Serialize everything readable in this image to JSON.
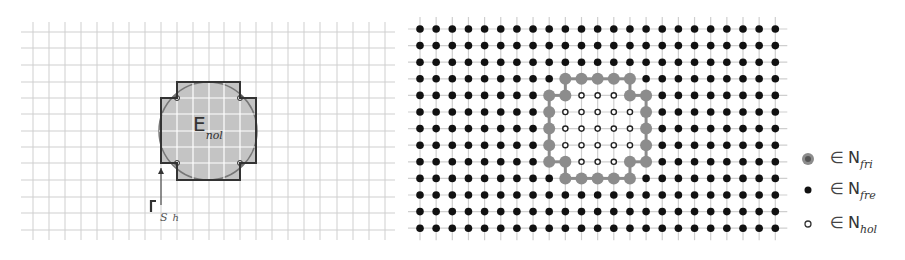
{
  "left_panel": {
    "grid": {
      "x_lines": [
        33,
        49,
        65,
        81,
        97,
        113,
        129,
        145,
        161,
        177,
        193,
        209,
        224,
        240,
        256,
        272,
        288,
        304,
        320,
        337,
        353,
        369,
        385
      ],
      "y_lines": [
        32,
        48,
        65,
        82,
        98,
        114,
        131,
        147,
        163,
        180,
        197,
        213,
        230
      ],
      "line_color": "#cfcfcf"
    },
    "region": {
      "circle_center": [
        208,
        131
      ],
      "circle_radius": 49,
      "fill_color": "#c4c4c4",
      "outline_color": "#333333",
      "step_polygon": [
        [
          177,
          82
        ],
        [
          240,
          82
        ],
        [
          240,
          98
        ],
        [
          256,
          98
        ],
        [
          256,
          163
        ],
        [
          240,
          163
        ],
        [
          240,
          180
        ],
        [
          177,
          180
        ],
        [
          177,
          163
        ],
        [
          161,
          163
        ],
        [
          161,
          98
        ],
        [
          177,
          98
        ]
      ]
    },
    "label_E": {
      "main": "E",
      "sub": "nol"
    },
    "boundary_arrow": {
      "from": [
        161,
        205
      ],
      "to": [
        161,
        168
      ]
    },
    "label_S": {
      "main": "S",
      "sub": "h"
    }
  },
  "right_panel": {
    "grid": {
      "x0": 420,
      "dx": 16.15,
      "cols": 23,
      "y0": 29,
      "dy": 16.6,
      "rows": 13,
      "line_color": "#cfcfcf"
    },
    "node_colors": {
      "free": "#111111",
      "frontier": "#8c8c8c",
      "hollow": "#ffffff"
    },
    "frontier_nodes": [
      [
        3,
        9
      ],
      [
        3,
        10
      ],
      [
        3,
        11
      ],
      [
        3,
        12
      ],
      [
        3,
        13
      ],
      [
        4,
        8
      ],
      [
        4,
        9
      ],
      [
        4,
        13
      ],
      [
        4,
        14
      ],
      [
        5,
        8
      ],
      [
        5,
        14
      ],
      [
        6,
        8
      ],
      [
        6,
        14
      ],
      [
        7,
        8
      ],
      [
        7,
        14
      ],
      [
        8,
        8
      ],
      [
        8,
        9
      ],
      [
        8,
        13
      ],
      [
        8,
        14
      ],
      [
        9,
        9
      ],
      [
        9,
        10
      ],
      [
        9,
        11
      ],
      [
        9,
        12
      ],
      [
        9,
        13
      ]
    ],
    "hollow_nodes": [
      [
        4,
        10
      ],
      [
        4,
        11
      ],
      [
        4,
        12
      ],
      [
        5,
        9
      ],
      [
        5,
        10
      ],
      [
        5,
        11
      ],
      [
        5,
        12
      ],
      [
        5,
        13
      ],
      [
        6,
        9
      ],
      [
        6,
        10
      ],
      [
        6,
        11
      ],
      [
        6,
        12
      ],
      [
        6,
        13
      ],
      [
        7,
        9
      ],
      [
        7,
        10
      ],
      [
        7,
        11
      ],
      [
        7,
        12
      ],
      [
        7,
        13
      ],
      [
        8,
        10
      ],
      [
        8,
        11
      ],
      [
        8,
        12
      ]
    ]
  },
  "legend": {
    "items": [
      {
        "marker": "frontier-node",
        "symbol": "∈",
        "set": "N",
        "sub": "fri"
      },
      {
        "marker": "free-node",
        "symbol": "∈",
        "set": "N",
        "sub": "fre"
      },
      {
        "marker": "hollow-node",
        "symbol": "∈",
        "set": "N",
        "sub": "hol"
      }
    ]
  }
}
